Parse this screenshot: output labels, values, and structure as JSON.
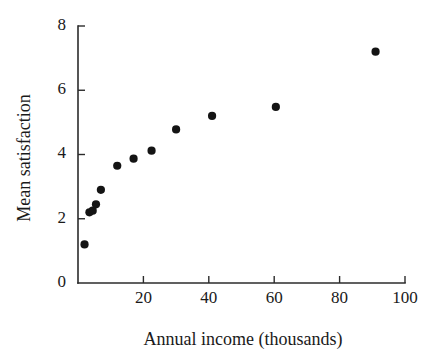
{
  "chart_data": {
    "type": "scatter",
    "title": "",
    "xlabel": "Annual income (thousands)",
    "ylabel": "Mean satisfaction",
    "xlim": [
      0,
      100
    ],
    "ylim": [
      0,
      8
    ],
    "xticks": [
      20,
      40,
      60,
      80,
      100
    ],
    "yticks": [
      0,
      2,
      4,
      6,
      8
    ],
    "xticklabels": [
      "20",
      "40",
      "60",
      "80",
      "100"
    ],
    "yticklabels": [
      "0",
      "2",
      "4",
      "6",
      "8"
    ],
    "grid": false,
    "legend": false,
    "tick_direction": "in",
    "marker": "filled-circle",
    "marker_color": "#141414",
    "axis_color": "#2b2b2b",
    "background_color": "#ffffff",
    "points": [
      {
        "x": 2.0,
        "y": 1.2
      },
      {
        "x": 3.5,
        "y": 2.2
      },
      {
        "x": 4.5,
        "y": 2.25
      },
      {
        "x": 5.5,
        "y": 2.45
      },
      {
        "x": 7.0,
        "y": 2.9
      },
      {
        "x": 12.0,
        "y": 3.65
      },
      {
        "x": 17.0,
        "y": 3.87
      },
      {
        "x": 22.5,
        "y": 4.12
      },
      {
        "x": 30.0,
        "y": 4.78
      },
      {
        "x": 41.0,
        "y": 5.2
      },
      {
        "x": 60.5,
        "y": 5.48
      },
      {
        "x": 91.0,
        "y": 7.2
      }
    ]
  },
  "figure": {
    "xlabel": "Annual income (thousands)",
    "ylabel": "Mean satisfaction"
  }
}
